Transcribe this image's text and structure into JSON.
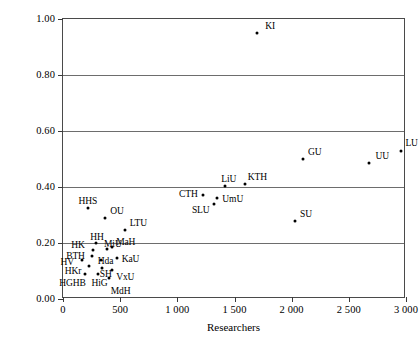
{
  "chart_data": {
    "type": "scatter",
    "title": "",
    "xlabel": "Researchers",
    "ylabel": "Normalized publications per researcher",
    "xlim": [
      0,
      3000
    ],
    "ylim": [
      0.0,
      1.0
    ],
    "grid": true,
    "legend": "none",
    "xticks": [
      {
        "value": 0,
        "label": "0"
      },
      {
        "value": 500,
        "label": "500"
      },
      {
        "value": 1000,
        "label": "1 000"
      },
      {
        "value": 1500,
        "label": "1 500"
      },
      {
        "value": 2000,
        "label": "2 000"
      },
      {
        "value": 2500,
        "label": "2 500"
      },
      {
        "value": 3000,
        "label": "3 000"
      }
    ],
    "yticks": [
      {
        "value": 0.0,
        "label": "0.00"
      },
      {
        "value": 0.2,
        "label": "0.20"
      },
      {
        "value": 0.4,
        "label": "0.40"
      },
      {
        "value": 0.6,
        "label": "0.60"
      },
      {
        "value": 0.8,
        "label": "0.80"
      },
      {
        "value": 1.0,
        "label": "1.00"
      }
    ],
    "gridlines_y": [
      0.2,
      0.4,
      0.6,
      0.8
    ],
    "point_color": "#000000",
    "points": [
      {
        "label": "KI",
        "x": 1700,
        "y": 0.95,
        "lx": 8,
        "ly": -11
      },
      {
        "label": "LU",
        "x": 2960,
        "y": 0.53,
        "lx": 4,
        "ly": -12
      },
      {
        "label": "GU",
        "x": 2100,
        "y": 0.5,
        "lx": 5,
        "ly": -11
      },
      {
        "label": "UU",
        "x": 2680,
        "y": 0.485,
        "lx": 6,
        "ly": -11
      },
      {
        "label": "KTH",
        "x": 1590,
        "y": 0.412,
        "lx": 3,
        "ly": -11
      },
      {
        "label": "LiU",
        "x": 1420,
        "y": 0.405,
        "lx": -4,
        "ly": -11
      },
      {
        "label": "CTH",
        "x": 1225,
        "y": 0.37,
        "lx": -24,
        "ly": -5
      },
      {
        "label": "UmU",
        "x": 1350,
        "y": 0.36,
        "lx": 5,
        "ly": -3
      },
      {
        "label": "SLU",
        "x": 1320,
        "y": 0.34,
        "lx": -22,
        "ly": 2
      },
      {
        "label": "HHS",
        "x": 215,
        "y": 0.325,
        "lx": -9,
        "ly": -11
      },
      {
        "label": "SU",
        "x": 2030,
        "y": 0.28,
        "lx": 5,
        "ly": -11
      },
      {
        "label": "OU",
        "x": 370,
        "y": 0.29,
        "lx": 5,
        "ly": -11
      },
      {
        "label": "LTU",
        "x": 540,
        "y": 0.245,
        "lx": 5,
        "ly": -11
      },
      {
        "label": "HH",
        "x": 290,
        "y": 0.2,
        "lx": -6,
        "ly": -10
      },
      {
        "label": "MaH",
        "x": 430,
        "y": 0.185,
        "lx": 4,
        "ly": -9
      },
      {
        "label": "MiU",
        "x": 385,
        "y": 0.178,
        "lx": -3,
        "ly": -9
      },
      {
        "label": "HK",
        "x": 265,
        "y": 0.175,
        "lx": -22,
        "ly": -9
      },
      {
        "label": "BTH",
        "x": 255,
        "y": 0.155,
        "lx": -26,
        "ly": -4
      },
      {
        "label": "KaU",
        "x": 470,
        "y": 0.148,
        "lx": 5,
        "ly": -3
      },
      {
        "label": "Hda",
        "x": 330,
        "y": 0.14,
        "lx": -3,
        "ly": -3
      },
      {
        "label": "HV",
        "x": 170,
        "y": 0.138,
        "lx": -22,
        "ly": -2
      },
      {
        "label": "HKr",
        "x": 225,
        "y": 0.118,
        "lx": -24,
        "ly": 1
      },
      {
        "label": "SH",
        "x": 340,
        "y": 0.11,
        "lx": -2,
        "ly": 2
      },
      {
        "label": "VxU",
        "x": 430,
        "y": 0.105,
        "lx": 4,
        "ly": 3
      },
      {
        "label": "HGHB",
        "x": 195,
        "y": 0.088,
        "lx": -26,
        "ly": 5
      },
      {
        "label": "HiG",
        "x": 310,
        "y": 0.088,
        "lx": -7,
        "ly": 5
      },
      {
        "label": "MdH",
        "x": 400,
        "y": 0.075,
        "lx": 2,
        "ly": 9
      }
    ]
  }
}
